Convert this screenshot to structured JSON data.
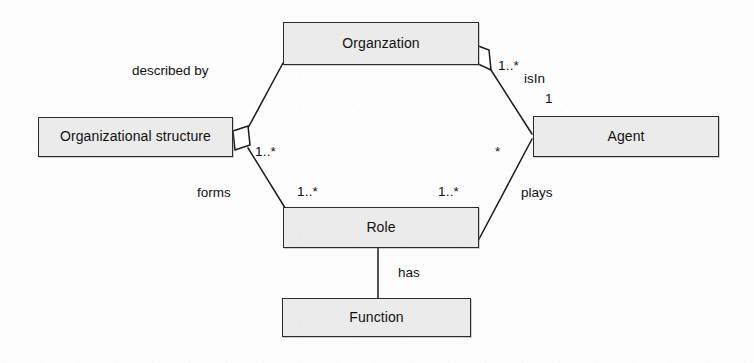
{
  "diagram": {
    "type": "uml-class-diagram",
    "colors": {
      "node_fill": "#ebebeb",
      "node_stroke": "#2b2b2b",
      "edge_stroke": "#1a1a1a",
      "text": "#111111",
      "background": "#fdfdfd"
    },
    "nodes": [
      {
        "id": "organization",
        "label": "Organzation",
        "x": 283,
        "y": 22,
        "w": 196,
        "h": 43
      },
      {
        "id": "organizational-structure",
        "label": "Organizational structure",
        "x": 38,
        "y": 117,
        "w": 195,
        "h": 40
      },
      {
        "id": "agent",
        "label": "Agent",
        "x": 533,
        "y": 116,
        "w": 186,
        "h": 41
      },
      {
        "id": "role",
        "label": "Role",
        "x": 283,
        "y": 207,
        "w": 196,
        "h": 41
      },
      {
        "id": "function",
        "label": "Function",
        "x": 282,
        "y": 298,
        "w": 189,
        "h": 39
      }
    ],
    "edges": [
      {
        "id": "structure-describes-organization",
        "from": "organizational-structure",
        "to": "organization",
        "label": "described by",
        "aggregation_end": "organizational-structure",
        "multiplicity_near_structure": "1..*"
      },
      {
        "id": "organization-isin-agent",
        "from": "organization",
        "to": "agent",
        "label": "isIn",
        "aggregation_end": "organization",
        "multiplicity_near_organization": "1..*",
        "multiplicity_near_agent": "1"
      },
      {
        "id": "structure-forms-role",
        "from": "organizational-structure",
        "to": "role",
        "label": "forms",
        "multiplicity_near_role": "1..*"
      },
      {
        "id": "agent-plays-role",
        "from": "agent",
        "to": "role",
        "label": "plays",
        "multiplicity_near_agent": "*",
        "multiplicity_near_role": "1..*"
      },
      {
        "id": "role-has-function",
        "from": "role",
        "to": "function",
        "label": "has"
      }
    ],
    "edge_labels": {
      "described_by": "described by",
      "is_in": "isIn",
      "forms": "forms",
      "plays": "plays",
      "has": "has"
    },
    "multiplicities": {
      "org_to_agent_org_side": "1..*",
      "org_to_agent_agent_side": "1",
      "structure_side": "1..*",
      "agent_to_role_agent_side": "*",
      "role_left": "1..*",
      "role_right": "1..*"
    }
  }
}
